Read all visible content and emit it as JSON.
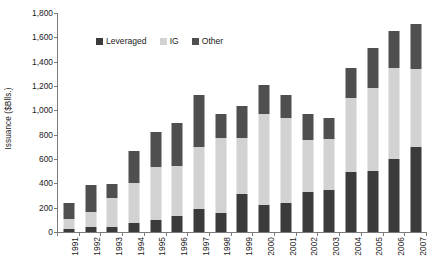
{
  "chart_data": {
    "type": "bar",
    "subtype": "stacked-column",
    "title": "",
    "xlabel": "",
    "ylabel": "Issuance ($Blls.)",
    "ylim": [
      0,
      1800
    ],
    "ytick_step": 200,
    "grid": false,
    "legend_position": "top-center",
    "ytick_labels": [
      "0",
      "200",
      "400",
      "600",
      "800",
      "1,000",
      "1,200",
      "1,400",
      "1,600",
      "1,800"
    ],
    "ytick_values": [
      0,
      200,
      400,
      600,
      800,
      1000,
      1200,
      1400,
      1600,
      1800
    ],
    "categories": [
      "1991",
      "1992",
      "1993",
      "1994",
      "1995",
      "1996",
      "1997",
      "1998",
      "1999",
      "2000",
      "2001",
      "2002",
      "2003",
      "2004",
      "2005",
      "2006",
      "2007"
    ],
    "series": [
      {
        "name": "Leveraged",
        "color": "#3b3b3b",
        "values": [
          25,
          40,
          45,
          70,
          95,
          130,
          190,
          155,
          315,
          225,
          235,
          330,
          345,
          490,
          500,
          600,
          700
        ]
      },
      {
        "name": "IG",
        "color": "#d2d2d2",
        "values": [
          85,
          125,
          235,
          330,
          440,
          410,
          510,
          620,
          455,
          745,
          705,
          430,
          420,
          615,
          680,
          745,
          640
        ]
      },
      {
        "name": "Other",
        "color": "#4f4f4f",
        "values": [
          125,
          225,
          115,
          270,
          285,
          360,
          430,
          195,
          265,
          235,
          185,
          210,
          175,
          245,
          330,
          305,
          370
        ]
      }
    ],
    "totals": [
      235,
      390,
      395,
      670,
      820,
      900,
      1130,
      970,
      1035,
      1205,
      1125,
      970,
      940,
      1350,
      1510,
      1650,
      1710
    ]
  },
  "axis": {
    "y_title": "Issuance ($Blls.)",
    "axis_color": "#7a7a7a"
  },
  "legend": {
    "items": [
      {
        "label": "Leveraged",
        "color": "#3b3b3b"
      },
      {
        "label": "IG",
        "color": "#d2d2d2"
      },
      {
        "label": "Other",
        "color": "#4f4f4f"
      }
    ]
  }
}
